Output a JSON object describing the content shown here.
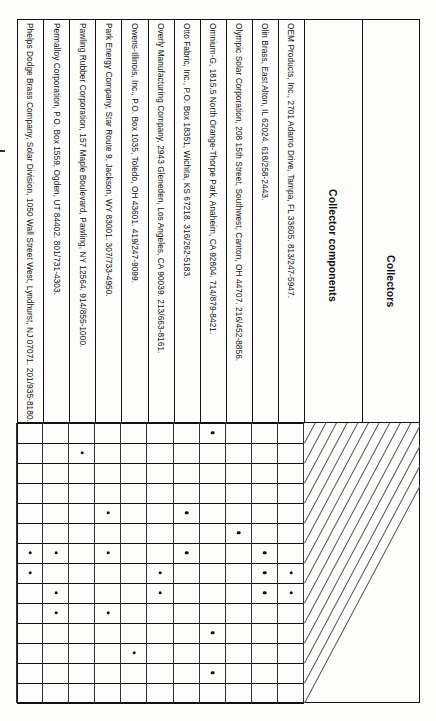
{
  "table": {
    "corner_header_top": "Collectors",
    "corner_header_bottom": "Collector components",
    "component_columns": [
      "reflectors, Fresnel lenses, heliostats",
      "seals, adhesives, gaskets",
      "mounting hardware",
      "insulation",
      "housing",
      "glazing",
      "coatings",
      "absorbers and tubing",
      "swimming pool",
      "flat plate liquid",
      "flat plate air",
      "hybrid",
      "vacuum tube",
      "concentrating"
    ],
    "companies": [
      "OEM Products, Inc., 2701 Adamo Drive, Tampa, FL 33605. 813/247-5947.",
      "Olin Brass, East Alton, IL 62024. 618/258-2443.",
      "Olympic Solar Corporation, 208 15th Street, Southwest, Canton, OH 44707. 216/452-8856.",
      "Omnium-G, 1815.5 North Orange-Thorpe Park, Anaheim, CA 92804. 714/879-8421.",
      "Otto Fabric, Inc., P.O. Box 18351, Wichita, KS 67218. 316/262-5183.",
      "Overly Manufacturing Company, 2943 Gleneden, Los Angeles, CA 90039. 213/663-8161.",
      "Owens-Illinois, Inc., P.O. Box 1035, Toledo, OH 43601. 419/247-9099.",
      "Park Energy Company, Star Route 9, Jackson, WY 83001. 307/733-4950.",
      "Pawling Rubber Corporation, 157 Maple Boulevard, Pawling, NY 12564. 914/855-1000.",
      "Permalloy Corporation, P.O. Box 1559, Ogden, UT 84402. 801/731-4303.",
      "Phelps Dodge Brass Company, Solar Division, 1050 Wall Street West, Lyndhurst, NJ 07071. 201/935-8180."
    ],
    "marks": [
      {
        "company": 3,
        "component": 0
      },
      {
        "company": 8,
        "component": 1
      },
      {
        "company": 4,
        "component": 4
      },
      {
        "company": 7,
        "component": 4
      },
      {
        "company": 2,
        "component": 5
      },
      {
        "company": 1,
        "component": 6
      },
      {
        "company": 4,
        "component": 6
      },
      {
        "company": 7,
        "component": 6
      },
      {
        "company": 9,
        "component": 6
      },
      {
        "company": 10,
        "component": 6
      },
      {
        "company": 0,
        "component": 7
      },
      {
        "company": 1,
        "component": 7
      },
      {
        "company": 5,
        "component": 7
      },
      {
        "company": 10,
        "component": 7
      },
      {
        "company": 0,
        "component": 8
      },
      {
        "company": 1,
        "component": 8
      },
      {
        "company": 5,
        "component": 8
      },
      {
        "company": 9,
        "component": 8
      },
      {
        "company": 7,
        "component": 9
      },
      {
        "company": 9,
        "component": 9
      },
      {
        "company": 3,
        "component": 10
      },
      {
        "company": 6,
        "component": 11
      },
      {
        "company": 3,
        "component": 12
      }
    ],
    "mark_glyph": "bullet"
  }
}
